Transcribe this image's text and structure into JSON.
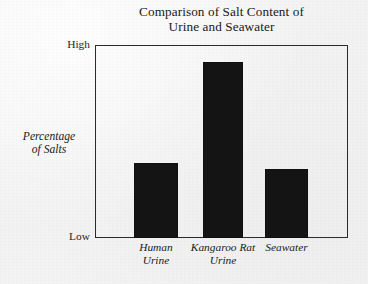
{
  "chart_data": {
    "type": "bar",
    "title": "Comparison of Salt Content of\nUrine and Seawater",
    "title_line1": "Comparison of Salt Content of",
    "title_line2": "Urine and Seawater",
    "xlabel": "",
    "ylabel": "Percentage\nof Salts",
    "ylabel_line1": "Percentage",
    "ylabel_line2": "of Salts",
    "categories": [
      "Human\nUrine",
      "Kangaroo Rat\nUrine",
      "Seawater"
    ],
    "category_names": [
      "Human Urine",
      "Kangaroo Rat Urine",
      "Seawater"
    ],
    "values": [
      39,
      91,
      36
    ],
    "ylim": [
      0,
      100
    ],
    "ytick_labels": [
      "Low",
      "High"
    ],
    "ytick_low": "Low",
    "ytick_high": "High",
    "grid": false,
    "legend": false,
    "bar_color": "#141414",
    "frame_color": "#2b2b2b",
    "background_color": "#f4f4f4",
    "bars": [
      {
        "label": "Human Urine",
        "label_wrapped": "Human\nUrine",
        "value": 39,
        "left_pct": 15.4,
        "width_pct": 17.4
      },
      {
        "label": "Kangaroo Rat Urine",
        "label_wrapped": "Kangaroo Rat\nUrine",
        "value": 91,
        "left_pct": 42.7,
        "width_pct": 15.8
      },
      {
        "label": "Seawater",
        "label_wrapped": "Seawater",
        "value": 36,
        "left_pct": 67.2,
        "width_pct": 17.0
      }
    ]
  }
}
